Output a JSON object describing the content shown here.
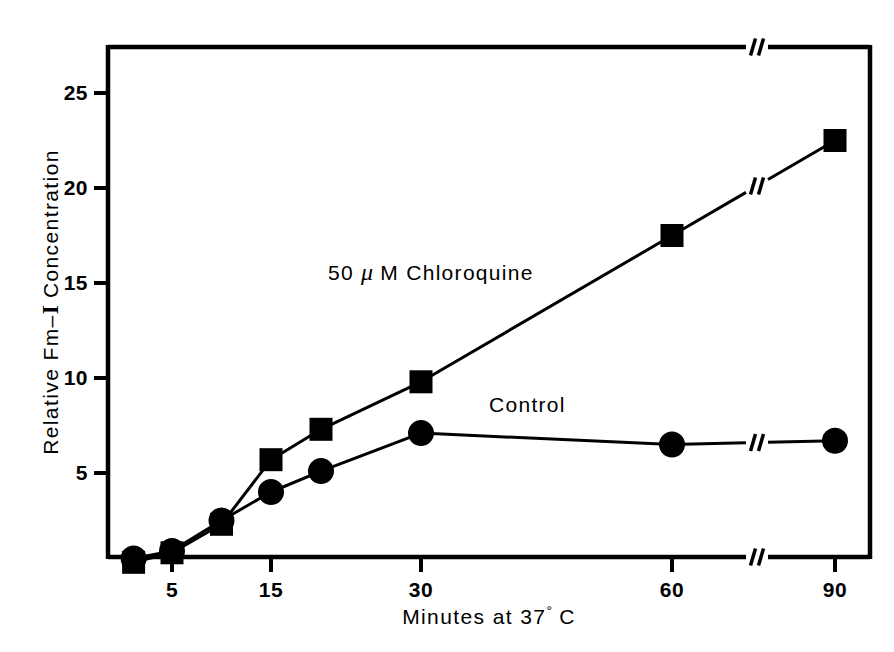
{
  "figure": {
    "background_color": "#ffffff",
    "ink_color": "#000000"
  },
  "chart_data": {
    "type": "line",
    "title": "",
    "xlabel_parts": {
      "prefix": "Minutes at 37",
      "degree": "°",
      "suffix": " C"
    },
    "xlabel": "Minutes at 37° C",
    "ylabel_parts": {
      "prefix": "Relative Fm",
      "dash": "–",
      "iodine": "I",
      "suffix": " Concentration"
    },
    "ylabel": "Relative Fm–I Concentration",
    "x_tick_labels": [
      "5",
      "15",
      "30",
      "60",
      "90"
    ],
    "x_tick_values": [
      5,
      15,
      30,
      60,
      90
    ],
    "y_tick_labels": [
      "5",
      "10",
      "15",
      "20",
      "25"
    ],
    "y_tick_values": [
      5,
      10,
      15,
      20,
      25
    ],
    "ylim": [
      0,
      27
    ],
    "grid": false,
    "legend_position": "inline-annotations",
    "axis_break": {
      "present": true,
      "axis": "x",
      "between": [
        60,
        90
      ],
      "style": "double-slash",
      "on_top_border": true,
      "on_bottom_border": true,
      "on_data_lines": true
    },
    "series": [
      {
        "name": "50 μ M Chloroquine",
        "annotation_label_parts": {
          "prefix": "50 ",
          "mu": "μ",
          "suffix": " M  Chloroquine"
        },
        "annotation_label": "50 μ M  Chloroquine",
        "marker": "square",
        "marker_filled": true,
        "x": [
          2,
          5,
          10,
          15,
          20,
          30,
          60,
          90
        ],
        "values": [
          0.3,
          0.8,
          2.3,
          5.7,
          7.3,
          9.8,
          17.5,
          22.5
        ]
      },
      {
        "name": "Control",
        "annotation_label": "Control",
        "marker": "circle",
        "marker_filled": true,
        "x": [
          2,
          5,
          10,
          15,
          20,
          30,
          60,
          90
        ],
        "values": [
          0.5,
          0.9,
          2.5,
          4.0,
          5.1,
          7.1,
          6.5,
          6.7
        ]
      }
    ]
  }
}
